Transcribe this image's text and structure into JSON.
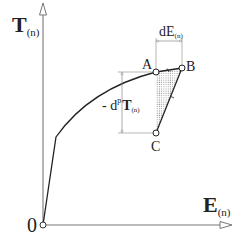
{
  "diagram": {
    "colors": {
      "axis": "#777777",
      "curve": "#222222",
      "dim": "#888888",
      "hatch": "#888888"
    },
    "axes": {
      "y_label": {
        "main": "T",
        "sub": "(n)"
      },
      "x_label": {
        "main": "E",
        "sub": "(n)"
      },
      "origin_label": "0"
    },
    "points": {
      "A": "A",
      "B": "B",
      "C": "C"
    },
    "dimensions": {
      "dE": {
        "main": "dE",
        "sub": "(n)"
      },
      "dpT": {
        "prefix": "- d",
        "sup": "p",
        "main": "T",
        "sub": "(n)"
      }
    },
    "curve_description": "Stress-strain curve: linear elastic from origin to yield kink, then hardening curve to A; increment A→B with elastic unloading B→C; shaded triangle ABC"
  }
}
